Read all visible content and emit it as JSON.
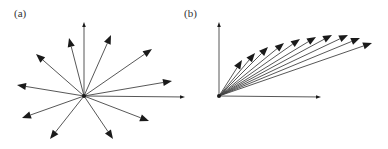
{
  "figure": {
    "panels": [
      {
        "label": "(a)",
        "label_pos": [
          14,
          7
        ],
        "origin": [
          84,
          96
        ],
        "arrows": [
          {
            "tip": [
              84,
              22
            ],
            "head": "small"
          },
          {
            "tip": [
              69,
              38
            ],
            "head": "large"
          },
          {
            "tip": [
              111,
              35
            ],
            "head": "large"
          },
          {
            "tip": [
              36,
              54
            ],
            "head": "large"
          },
          {
            "tip": [
              152,
              49
            ],
            "head": "large"
          },
          {
            "tip": [
              17,
              85
            ],
            "head": "large"
          },
          {
            "tip": [
              172,
              81
            ],
            "head": "large"
          },
          {
            "tip": [
              185,
              97
            ],
            "head": "small"
          },
          {
            "tip": [
              22,
              118
            ],
            "head": "large"
          },
          {
            "tip": [
              149,
              121
            ],
            "head": "large"
          },
          {
            "tip": [
              50,
              139
            ],
            "head": "large"
          },
          {
            "tip": [
              113,
              139
            ],
            "head": "large"
          }
        ]
      },
      {
        "label": "(b)",
        "label_pos": [
          184,
          7
        ],
        "origin": [
          219,
          96
        ],
        "axes": {
          "y_axis_tip": [
            219,
            22
          ],
          "x_axis_tip": [
            321,
            97
          ]
        },
        "arrows": [
          {
            "tip": [
              242,
              60
            ],
            "head": "large"
          },
          {
            "tip": [
              255,
              53
            ],
            "head": "large"
          },
          {
            "tip": [
              268,
              47
            ],
            "head": "large"
          },
          {
            "tip": [
              284,
              43
            ],
            "head": "large"
          },
          {
            "tip": [
              300,
              39
            ],
            "head": "large"
          },
          {
            "tip": [
              316,
              37
            ],
            "head": "large"
          },
          {
            "tip": [
              332,
              35
            ],
            "head": "large"
          },
          {
            "tip": [
              348,
              35
            ],
            "head": "large"
          },
          {
            "tip": [
              360,
              38
            ],
            "head": "large"
          },
          {
            "tip": [
              372,
              43
            ],
            "head": "large"
          }
        ]
      }
    ],
    "colors": {
      "stroke": "#444444",
      "head": "#1a1a1a",
      "background": "#ffffff"
    }
  }
}
